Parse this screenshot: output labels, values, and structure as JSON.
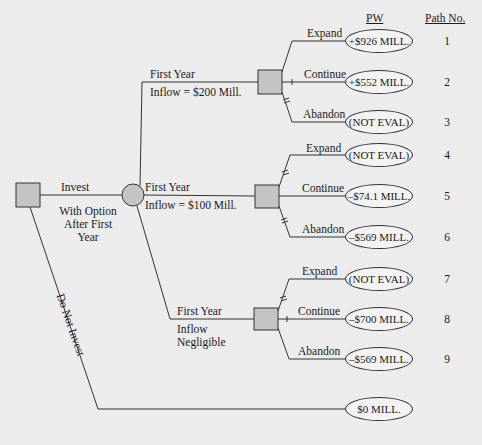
{
  "headers": {
    "pw": "PW",
    "path_no": "Path No."
  },
  "root": {
    "invest_label": "Invest",
    "invest_sublabel": [
      "With Option",
      "After First",
      "Year"
    ],
    "do_not_invest_label": "Do Not Invest"
  },
  "branches": [
    {
      "chance_label": "First Year",
      "chance_sublabel": "Inflow = $200 Mill.",
      "options": [
        {
          "label": "Expand",
          "pw": "+$926 MILL.",
          "path": "1",
          "blocked": false
        },
        {
          "label": "Continue",
          "pw": "+$552 MILL.",
          "path": "2",
          "blocked": false
        },
        {
          "label": "Abandon",
          "pw": "(NOT EVAL)",
          "path": "3",
          "blocked": true
        }
      ]
    },
    {
      "chance_label": "First Year",
      "chance_sublabel": "Inflow = $100 Mill.",
      "options": [
        {
          "label": "Expand",
          "pw": "(NOT EVAL)",
          "path": "4",
          "blocked": true
        },
        {
          "label": "Continue",
          "pw": "–$74.1 MILL.",
          "path": "5",
          "blocked": false
        },
        {
          "label": "Abandon",
          "pw": "–$569 MILL.",
          "path": "6",
          "blocked": true
        }
      ]
    },
    {
      "chance_label": "First Year",
      "chance_sublabel": [
        "Inflow",
        "Negligible"
      ],
      "options": [
        {
          "label": "Expand",
          "pw": "(NOT EVAL)",
          "path": "7",
          "blocked": true
        },
        {
          "label": "Continue",
          "pw": "–$700 MILL.",
          "path": "8",
          "blocked": false
        },
        {
          "label": "Abandon",
          "pw": "–$569 MILL.",
          "path": "9",
          "blocked": false
        }
      ]
    }
  ],
  "do_not_invest_pw": "$0 MILL.",
  "colors": {
    "node_fill": "#c4c4c4",
    "line": "#333333",
    "background": "#ececec"
  }
}
